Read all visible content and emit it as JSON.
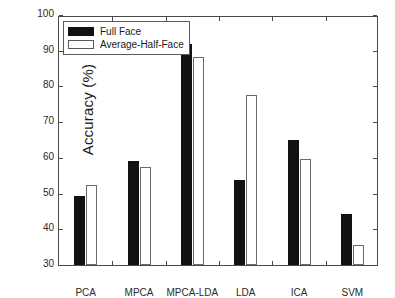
{
  "chart_data": {
    "type": "bar",
    "title": "",
    "xlabel": "",
    "ylabel": "Accuracy (%)",
    "ylim": [
      30,
      100
    ],
    "yticks": [
      30,
      40,
      50,
      60,
      70,
      80,
      90,
      100
    ],
    "grid": false,
    "legend_position": "top-left",
    "categories": [
      "PCA",
      "MPCA",
      "MPCA-LDA",
      "LDA",
      "ICA",
      "SVM"
    ],
    "series": [
      {
        "name": "Full Face",
        "color": "#111111",
        "values": [
          49.3,
          59.0,
          92.0,
          53.8,
          65.0,
          44.2
        ]
      },
      {
        "name": "Average-Half-Face",
        "color": "#ffffff",
        "values": [
          52.3,
          57.5,
          88.3,
          77.6,
          59.7,
          35.6
        ]
      }
    ]
  },
  "axis": {
    "y_label": "Accuracy (%)",
    "y_tick_labels": [
      "30",
      "40",
      "50",
      "60",
      "70",
      "80",
      "90",
      "100"
    ],
    "x_tick_labels": [
      "PCA",
      "MPCA",
      "MPCA-LDA",
      "LDA",
      "ICA",
      "SVM"
    ]
  },
  "legend": {
    "entries": [
      {
        "label": "Full Face",
        "swatch": "filled-black-square"
      },
      {
        "label": "Average-Half-Face",
        "swatch": "open-white-square"
      }
    ]
  }
}
